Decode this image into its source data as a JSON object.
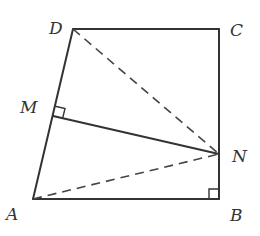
{
  "figure": {
    "type": "geometry",
    "labels": {
      "A": "A",
      "B": "B",
      "C": "C",
      "D": "D",
      "M": "M",
      "N": "N"
    },
    "points": {
      "A": [
        33,
        199
      ],
      "B": [
        219,
        199
      ],
      "C": [
        219,
        29
      ],
      "D": [
        73,
        29
      ],
      "M": [
        53,
        116
      ],
      "N": [
        219,
        154
      ]
    },
    "solid_segments": [
      "AB",
      "BC",
      "CD",
      "DA",
      "MN"
    ],
    "dashed_segments": [
      "DN",
      "AN"
    ],
    "right_angles": [
      "DMN (at M)",
      "ABC (at B)"
    ],
    "colors": {
      "stroke": "#333333",
      "background": "#ffffff"
    }
  }
}
